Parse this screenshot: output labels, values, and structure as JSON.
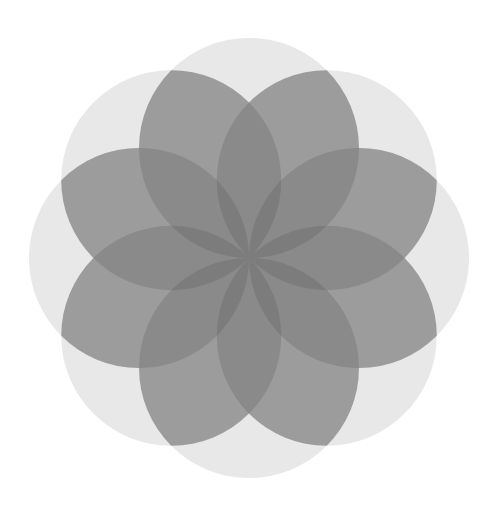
{
  "figure": {
    "title": "Overlapping circles flower pattern",
    "center": [
      249,
      258
    ],
    "circle_count": 8,
    "circle_radius": 110,
    "start_angle_deg": -90,
    "background": "#ffffff",
    "coverage_colors": {
      "1": "#e8e8e8",
      "2": "#9c9c9c",
      "3": "#8a8a8a",
      "4": "#7c7c7c"
    }
  }
}
